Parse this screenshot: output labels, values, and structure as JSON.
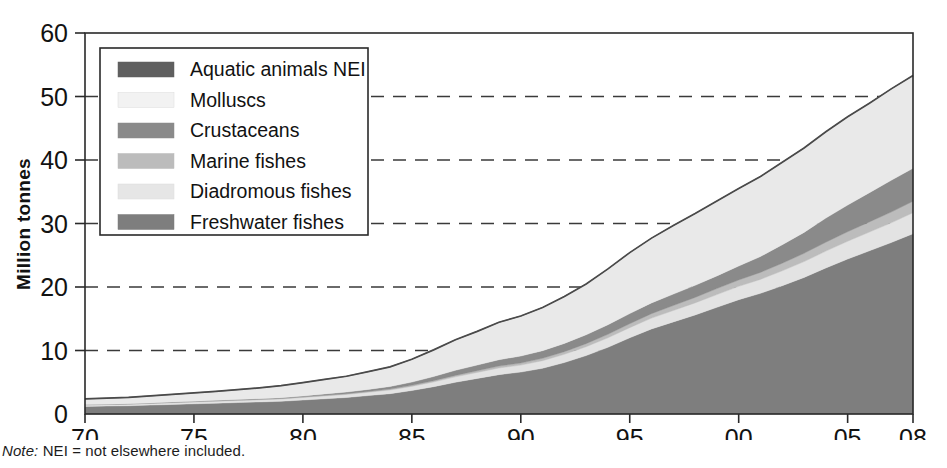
{
  "figure": {
    "note_prefix": "Note:",
    "note_text": " NEI = not elsewhere included."
  },
  "chart_data": {
    "type": "area",
    "stacked": true,
    "title": "",
    "xlabel": "",
    "ylabel": "Million tonnes",
    "xlim": [
      1970,
      2008
    ],
    "ylim": [
      0,
      60
    ],
    "yticks": [
      0,
      10,
      20,
      30,
      40,
      50,
      60
    ],
    "ytick_labels": [
      "0",
      "10",
      "20",
      "30",
      "40",
      "50",
      "60"
    ],
    "xticks": [
      1970,
      1975,
      1980,
      1985,
      1990,
      1995,
      2000,
      2005,
      2008
    ],
    "xtick_labels": [
      "70",
      "75",
      "80",
      "85",
      "90",
      "95",
      "00",
      "05",
      "08"
    ],
    "grid": "horizontal-dashed",
    "legend_position": "upper-left-inside",
    "x": [
      1970,
      1971,
      1972,
      1973,
      1974,
      1975,
      1976,
      1977,
      1978,
      1979,
      1980,
      1981,
      1982,
      1983,
      1984,
      1985,
      1986,
      1987,
      1988,
      1989,
      1990,
      1991,
      1992,
      1993,
      1994,
      1995,
      1996,
      1997,
      1998,
      1999,
      2000,
      2001,
      2002,
      2003,
      2004,
      2005,
      2006,
      2007,
      2008
    ],
    "stack_order_bottom_to_top": [
      "Freshwater fishes",
      "Diadromous fishes",
      "Marine fishes",
      "Crustaceans",
      "Molluscs",
      "Aquatic animals NEI"
    ],
    "series": [
      {
        "name": "Freshwater fishes",
        "color": "#7e7e7e",
        "values": [
          1.2,
          1.25,
          1.3,
          1.4,
          1.5,
          1.6,
          1.7,
          1.8,
          1.9,
          2.0,
          2.2,
          2.4,
          2.6,
          2.9,
          3.2,
          3.7,
          4.3,
          5.0,
          5.6,
          6.2,
          6.6,
          7.2,
          8.1,
          9.2,
          10.5,
          12.0,
          13.4,
          14.5,
          15.6,
          16.8,
          18.0,
          19.0,
          20.2,
          21.5,
          23.0,
          24.4,
          25.7,
          27.0,
          28.4
        ]
      },
      {
        "name": "Diadromous fishes",
        "color": "#e3e3e3",
        "values": [
          0.2,
          0.2,
          0.22,
          0.24,
          0.26,
          0.28,
          0.3,
          0.32,
          0.34,
          0.36,
          0.4,
          0.44,
          0.48,
          0.52,
          0.58,
          0.65,
          0.75,
          0.85,
          0.95,
          1.05,
          1.1,
          1.2,
          1.3,
          1.4,
          1.5,
          1.6,
          1.7,
          1.8,
          1.9,
          2.0,
          2.1,
          2.2,
          2.35,
          2.5,
          2.65,
          2.8,
          2.95,
          3.1,
          3.3
        ]
      },
      {
        "name": "Marine fishes",
        "color": "#bcbcbc",
        "values": [
          0.05,
          0.05,
          0.05,
          0.06,
          0.06,
          0.07,
          0.07,
          0.08,
          0.08,
          0.09,
          0.1,
          0.11,
          0.12,
          0.13,
          0.15,
          0.17,
          0.2,
          0.23,
          0.26,
          0.3,
          0.33,
          0.37,
          0.42,
          0.48,
          0.55,
          0.62,
          0.7,
          0.78,
          0.86,
          0.95,
          1.0,
          1.1,
          1.2,
          1.3,
          1.4,
          1.5,
          1.6,
          1.7,
          1.8
        ]
      },
      {
        "name": "Crustaceans",
        "color": "#8a8a8a",
        "values": [
          0.04,
          0.04,
          0.05,
          0.05,
          0.06,
          0.07,
          0.08,
          0.09,
          0.1,
          0.12,
          0.15,
          0.2,
          0.25,
          0.32,
          0.4,
          0.5,
          0.65,
          0.8,
          0.9,
          1.0,
          1.1,
          1.2,
          1.3,
          1.4,
          1.5,
          1.6,
          1.7,
          1.8,
          1.9,
          2.0,
          2.2,
          2.5,
          2.9,
          3.3,
          3.8,
          4.2,
          4.6,
          5.0,
          5.2
        ]
      },
      {
        "name": "Molluscs",
        "color": "#e9e9e9",
        "values": [
          0.9,
          0.95,
          1.0,
          1.1,
          1.2,
          1.3,
          1.4,
          1.55,
          1.7,
          1.9,
          2.1,
          2.3,
          2.5,
          2.8,
          3.1,
          3.6,
          4.2,
          4.8,
          5.3,
          5.9,
          6.3,
          6.8,
          7.4,
          8.0,
          8.8,
          9.6,
          10.2,
          10.8,
          11.3,
          11.8,
          12.2,
          12.6,
          13.0,
          13.3,
          13.6,
          13.9,
          14.1,
          14.4,
          14.6
        ]
      },
      {
        "name": "Aquatic animals NEI",
        "color": "#5f5f5f",
        "values": [
          0.0,
          0.0,
          0.0,
          0.0,
          0.0,
          0.0,
          0.0,
          0.0,
          0.0,
          0.0,
          0.0,
          0.0,
          0.0,
          0.0,
          0.0,
          0.0,
          0.0,
          0.0,
          0.0,
          0.0,
          0.0,
          0.0,
          0.0,
          0.0,
          0.0,
          0.0,
          0.0,
          0.0,
          0.0,
          0.0,
          0.0,
          0.0,
          0.0,
          0.0,
          0.0,
          0.0,
          0.0,
          0.0,
          0.0
        ]
      }
    ],
    "totals": [
      2.4,
      2.5,
      2.6,
      2.85,
      3.1,
      3.3,
      3.55,
      3.85,
      4.1,
      4.5,
      5.0,
      5.5,
      6.0,
      6.7,
      7.4,
      8.6,
      10.1,
      11.5,
      13.0,
      14.4,
      15.4,
      16.8,
      18.5,
      20.5,
      22.8,
      25.4,
      27.7,
      29.7,
      31.5,
      33.5,
      35.5,
      37.4,
      39.6,
      41.9,
      44.4,
      46.8,
      48.9,
      51.2,
      53.3
    ]
  },
  "legend": {
    "items": [
      {
        "label": "Aquatic animals NEI",
        "swatch": "#5f5f5f"
      },
      {
        "label": "Molluscs",
        "swatch": "#f2f2f2"
      },
      {
        "label": "Crustaceans",
        "swatch": "#8a8a8a"
      },
      {
        "label": "Marine fishes",
        "swatch": "#bcbcbc"
      },
      {
        "label": "Diadromous fishes",
        "swatch": "#e6e6e6"
      },
      {
        "label": "Freshwater fishes",
        "swatch": "#7e7e7e"
      }
    ]
  }
}
